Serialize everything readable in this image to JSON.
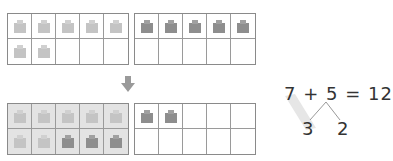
{
  "top_row": {
    "left_frame": {
      "cube_color": "#c4c4c4",
      "filled_cells": 7
    },
    "right_frame": {
      "cube_color": "#8e8e8e",
      "filled_cells": 5
    }
  },
  "arrow": {
    "icon": "down-arrow-icon",
    "color": "#9a9a9a"
  },
  "bottom_row": {
    "left_frame": {
      "shade_color": "#e3e3e3",
      "light_cells": 7,
      "dark_cells": 3,
      "light_color": "#c4c4c4",
      "dark_color": "#8e8e8e"
    },
    "right_frame": {
      "cube_color": "#8e8e8e",
      "filled_cells": 2
    }
  },
  "equation": {
    "text": "7 + 5 = 12",
    "addend_1": "7",
    "plus": "+",
    "addend_2": "5",
    "equals": "=",
    "sum": "12",
    "split_left": "3",
    "split_right": "2",
    "highlight_color": "#e6e6e6"
  }
}
